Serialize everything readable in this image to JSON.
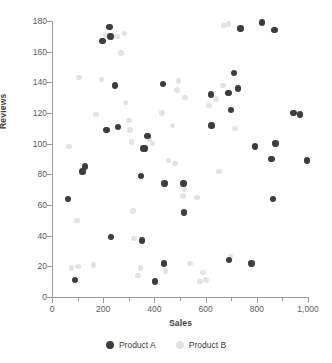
{
  "chart_data": {
    "type": "scatter",
    "title": "",
    "xlabel": "Sales",
    "ylabel": "Reviews",
    "xlim": [
      0,
      1000
    ],
    "ylim": [
      0,
      180
    ],
    "grid": false,
    "legend_position": "bottom",
    "x_ticks": [
      0,
      200,
      400,
      600,
      800,
      1000
    ],
    "x_tick_labels": [
      "0",
      "200",
      "400",
      "600",
      "800",
      "1,000"
    ],
    "x_minor_ticks": [
      100,
      300,
      500,
      700,
      900
    ],
    "y_ticks": [
      0,
      20,
      40,
      60,
      80,
      100,
      120,
      140,
      160,
      180
    ],
    "y_tick_labels": [
      "0",
      "20",
      "40",
      "60",
      "80",
      "100",
      "120",
      "140",
      "160",
      "180"
    ],
    "series": [
      {
        "name": "Product A",
        "color": "#3d3d3d",
        "marker": "circle",
        "points": [
          [
            63,
            64
          ],
          [
            90,
            11
          ],
          [
            120,
            82
          ],
          [
            129,
            85
          ],
          [
            197,
            167
          ],
          [
            212,
            109
          ],
          [
            224,
            176
          ],
          [
            228,
            170
          ],
          [
            230,
            39
          ],
          [
            246,
            138
          ],
          [
            257,
            111
          ],
          [
            347,
            79
          ],
          [
            352,
            37
          ],
          [
            358,
            97
          ],
          [
            363,
            97
          ],
          [
            373,
            105
          ],
          [
            402,
            10
          ],
          [
            434,
            139
          ],
          [
            437,
            22
          ],
          [
            440,
            74
          ],
          [
            513,
            74
          ],
          [
            516,
            55
          ],
          [
            622,
            132
          ],
          [
            624,
            112
          ],
          [
            689,
            133
          ],
          [
            692,
            24
          ],
          [
            699,
            122
          ],
          [
            711,
            146
          ],
          [
            727,
            136
          ],
          [
            737,
            175
          ],
          [
            779,
            22
          ],
          [
            793,
            98
          ],
          [
            820,
            179
          ],
          [
            858,
            90
          ],
          [
            864,
            64
          ],
          [
            869,
            174
          ],
          [
            874,
            100
          ],
          [
            944,
            120
          ],
          [
            968,
            119
          ],
          [
            996,
            89
          ]
        ]
      },
      {
        "name": "Product B",
        "color": "#e3e3e3",
        "marker": "circle",
        "points": [
          [
            66,
            98
          ],
          [
            76,
            19
          ],
          [
            97,
            50
          ],
          [
            101,
            20
          ],
          [
            106,
            143
          ],
          [
            162,
            21
          ],
          [
            172,
            119
          ],
          [
            194,
            142
          ],
          [
            209,
            171
          ],
          [
            253,
            170
          ],
          [
            270,
            159
          ],
          [
            288,
            127
          ],
          [
            300,
            115
          ],
          [
            305,
            109
          ],
          [
            310,
            101
          ],
          [
            317,
            56
          ],
          [
            321,
            38
          ],
          [
            335,
            14
          ],
          [
            346,
            19
          ],
          [
            381,
            103
          ],
          [
            430,
            120
          ],
          [
            456,
            89
          ],
          [
            470,
            112
          ],
          [
            481,
            87
          ],
          [
            489,
            135
          ],
          [
            494,
            141
          ],
          [
            512,
            66
          ],
          [
            518,
            70
          ],
          [
            540,
            22
          ],
          [
            566,
            65
          ],
          [
            578,
            10
          ],
          [
            589,
            16
          ],
          [
            601,
            11
          ],
          [
            614,
            125
          ],
          [
            640,
            129
          ],
          [
            652,
            82
          ],
          [
            668,
            138
          ],
          [
            672,
            177
          ],
          [
            690,
            178
          ],
          [
            698,
            26
          ],
          [
            443,
            17
          ],
          [
            283,
            172
          ],
          [
            520,
            130
          ],
          [
            393,
            100
          ],
          [
            714,
            110
          ]
        ]
      }
    ]
  },
  "legend": {
    "items": [
      {
        "label": "Product A",
        "color": "#3d3d3d"
      },
      {
        "label": "Product B",
        "color": "#e3e3e3"
      }
    ]
  }
}
